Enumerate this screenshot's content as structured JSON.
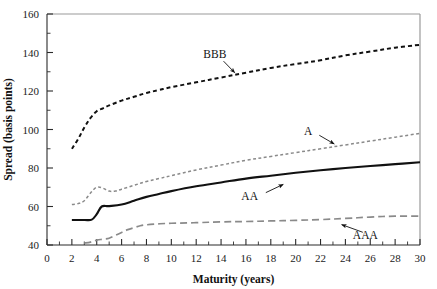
{
  "chart_data": {
    "type": "line",
    "title": "",
    "xlabel": "Maturity (years)",
    "ylabel": "Spread (basis points)",
    "xlim": [
      0,
      30
    ],
    "ylim": [
      40,
      160
    ],
    "grid": false,
    "legend_position": "inline-annotations",
    "x_major_ticks": [
      0,
      2,
      4,
      6,
      8,
      10,
      12,
      14,
      16,
      18,
      20,
      22,
      24,
      26,
      28,
      30
    ],
    "x_tick_labels": [
      "0",
      "2",
      "4",
      "6",
      "8",
      "10",
      "12",
      "14",
      "16",
      "18",
      "20",
      "22",
      "24",
      "26",
      "28",
      "30"
    ],
    "x_minor_step": 1,
    "y_major_ticks": [
      40,
      60,
      80,
      100,
      120,
      140,
      160
    ],
    "y_tick_labels": [
      "40",
      "60",
      "80",
      "100",
      "120",
      "140",
      "160"
    ],
    "y_minor_step": 10,
    "series": [
      {
        "name": "BBB",
        "color": "#111111",
        "style": "short-dash",
        "stroke_width": 2.0,
        "dasharray": "4,3",
        "x": [
          2.0,
          2.5,
          3.0,
          3.5,
          4.0,
          4.5,
          5.0,
          6.0,
          7.0,
          8.0,
          9.0,
          10.0,
          12.0,
          14.0,
          16.0,
          18.0,
          20.0,
          22.0,
          24.0,
          26.0,
          28.0,
          30.0
        ],
        "values": [
          90,
          95,
          101,
          106,
          109.5,
          111,
          112.5,
          115,
          117,
          119,
          120.5,
          122,
          124.5,
          127,
          129.5,
          132,
          134,
          136,
          138.5,
          140.5,
          142.5,
          144
        ]
      },
      {
        "name": "A",
        "color": "#8a8a8a",
        "style": "fine-dash",
        "stroke_width": 1.5,
        "dasharray": "3,2.5",
        "x": [
          2.0,
          2.5,
          3.0,
          3.5,
          4.0,
          4.5,
          5.0,
          5.5,
          6.0,
          7.0,
          8.0,
          9.0,
          10.0,
          12.0,
          14.0,
          16.0,
          18.0,
          20.0,
          22.0,
          24.0,
          26.0,
          28.0,
          30.0
        ],
        "values": [
          61,
          61.5,
          63,
          67,
          70,
          69.5,
          68,
          68,
          69,
          71,
          73,
          74.5,
          76,
          79,
          81.5,
          84,
          86,
          88,
          90,
          92,
          94,
          96,
          98
        ]
      },
      {
        "name": "AA",
        "color": "#111111",
        "style": "solid",
        "stroke_width": 2.1,
        "dasharray": "none",
        "x": [
          2.0,
          3.0,
          3.6,
          4.0,
          4.4,
          5.0,
          6.0,
          7.0,
          8.0,
          9.0,
          10.0,
          12.0,
          14.0,
          16.0,
          18.0,
          20.0,
          22.0,
          24.0,
          26.0,
          28.0,
          30.0
        ],
        "values": [
          53,
          53,
          53.2,
          56,
          60,
          60.2,
          61,
          63,
          65,
          66.5,
          68,
          70.5,
          72.5,
          74.5,
          76,
          77.5,
          78.8,
          80,
          81,
          82,
          83
        ]
      },
      {
        "name": "AAA",
        "color": "#8a8a8a",
        "style": "long-dash",
        "stroke_width": 1.7,
        "dasharray": "7,4",
        "x": [
          3.0,
          3.5,
          4.0,
          4.5,
          5.0,
          5.5,
          6.0,
          6.5,
          7.0,
          7.5,
          8.0,
          9.0,
          10.0,
          12.0,
          14.0,
          16.0,
          18.0,
          20.0,
          22.0,
          24.0,
          26.0,
          28.0,
          30.0
        ],
        "values": [
          41,
          41.5,
          42.5,
          43,
          43.5,
          45,
          46.5,
          48,
          49,
          50,
          50.5,
          51,
          51.3,
          51.6,
          52,
          52.2,
          52.5,
          52.8,
          53.2,
          53.8,
          54.5,
          55,
          55
        ]
      }
    ],
    "annotations": [
      {
        "label": "BBB",
        "text_x": 13.5,
        "text_y": 139,
        "arrow_from_x": 14.2,
        "arrow_from_y": 135.5,
        "arrow_to_x": 15.1,
        "arrow_to_y": 129.5
      },
      {
        "label": "A",
        "text_x": 21.0,
        "text_y": 99,
        "arrow_from_x": 21.9,
        "arrow_from_y": 97.0,
        "arrow_to_x": 23.1,
        "arrow_to_y": 92.5
      },
      {
        "label": "AA",
        "text_x": 16.3,
        "text_y": 65.5,
        "arrow_from_x": 17.6,
        "arrow_from_y": 67.2,
        "arrow_to_x": 19.0,
        "arrow_to_y": 71.5
      },
      {
        "label": "AAA",
        "text_x": 25.6,
        "text_y": 45.2,
        "arrow_from_x": 25.4,
        "arrow_from_y": 46.6,
        "arrow_to_x": 23.7,
        "arrow_to_y": 50.6
      }
    ]
  }
}
